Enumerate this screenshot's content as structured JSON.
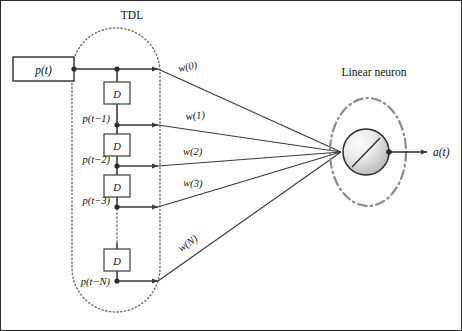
{
  "diagram": {
    "title_tdl": "TDL",
    "title_neuron": "Linear neuron",
    "input": {
      "label": "p(t)"
    },
    "delay_symbol": "D",
    "taps": [
      {
        "id": "tap0",
        "label": "",
        "weight": "w(0)"
      },
      {
        "id": "tap1",
        "label": "p(t−1)",
        "weight": "w(1)"
      },
      {
        "id": "tap2",
        "label": "p(t−2)",
        "weight": "w(2)"
      },
      {
        "id": "tap3",
        "label": "p(t−3)",
        "weight": "w(3)"
      },
      {
        "id": "tapN",
        "label": "p(t−N)",
        "weight": "w(N)"
      }
    ],
    "output": {
      "label": "a(t)"
    },
    "colors": {
      "line": "#3a3a3a",
      "dotted_boundary": "#6b6b6b",
      "neuron_ellipse": "#8c8c8c",
      "neuron_fill_light": "#f2f2f2",
      "neuron_fill_dark": "#b9b9b9",
      "text": "#111111",
      "background": "#ffffff"
    }
  }
}
